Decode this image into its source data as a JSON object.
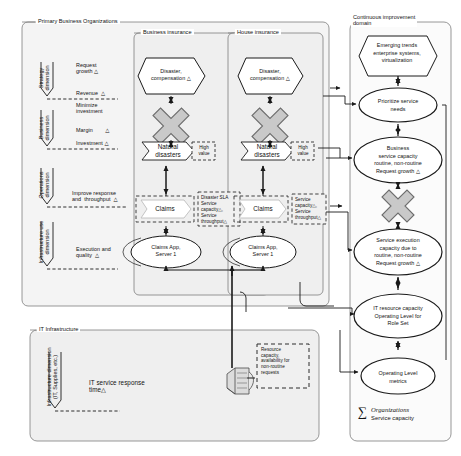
{
  "diagram": {
    "groups": {
      "primary": "Primary Business  Organizations",
      "business_insurance": "Business insurance",
      "house_insurance": "House insurance",
      "continuous_improvement": "Continuous improvement\ndomain",
      "it_infrastructure": "IT Infrastructure"
    },
    "dimensions": [
      {
        "name": "strategy",
        "axis": "Strategy\ndimension",
        "items": [
          "Request\ngrowth △",
          "Revenue  △"
        ]
      },
      {
        "name": "business",
        "axis": "Business\ndimension",
        "items": [
          "Minimize\ninvestment",
          "Margin        △",
          "Investment △"
        ]
      },
      {
        "name": "operations",
        "axis": "Operations\ndimension",
        "items": [
          "Improve response\nand  throughput  △"
        ]
      },
      {
        "name": "infrastructure-use",
        "axis": "Infrastructure use\ndimension",
        "items": [
          "Execution and\nquality  △"
        ]
      }
    ],
    "it_dimension_axis": "Infrastructure dimension\n(IT, Supplies, etc.)",
    "it_service_response": "IT service response\ntime△",
    "resource_note": "Resource\ncapacity,\navailability for\nnon-routine\nrequests",
    "business_insurance_column": {
      "hexagon": "Disaster,\ncompensation △",
      "cross": "conflict-cross",
      "banner": "Natural\ndisasters",
      "side_note": "High\nvalue",
      "claims": "Claims",
      "claims_note": "Disaster SLA\nService\ncapacity△,\nService\nthroughput△",
      "server": "Claims App,\nServer 1"
    },
    "house_insurance_column": {
      "hexagon": "Disaster,\ncompensation △",
      "cross": "conflict-cross",
      "banner": "Natural\ndisasters",
      "side_note": "High\nvalue",
      "claims": "Claims",
      "claims_note": "Service\ncapacity△,\nService\nthroughput△",
      "server": "Claims App,\nServer 1"
    },
    "improvement_nodes": [
      {
        "id": "emerging-trends",
        "shape": "hexagon",
        "label": "Emerging trends\nenterprise systems,\nvirtualization"
      },
      {
        "id": "prioritize-service-needs",
        "shape": "ellipse",
        "label": "Prioritize service\nneeds"
      },
      {
        "id": "business-service-capacity",
        "shape": "ellipse",
        "label": "Business\nservice capacity\nroutine, non-routine\nRequest growth △"
      },
      {
        "id": "conflict-cross",
        "shape": "cross",
        "label": ""
      },
      {
        "id": "service-execution-capacity",
        "shape": "ellipse",
        "label": "Service execution\ncapacity due to\nroutine, non-routine\nRequest growth △"
      },
      {
        "id": "it-resource-capacity",
        "shape": "ellipse",
        "label": "IT resource capacity\nOperating Level for\nRole Set"
      },
      {
        "id": "operating-level-metrics",
        "shape": "ellipse",
        "label": "Operating Level\nmetrics"
      }
    ],
    "summation": {
      "symbol": "∑",
      "line1": "Organizations",
      "line2": "Service capacity"
    },
    "colors": {
      "line": "#1a1a1a",
      "panel_fill": "#f2f2f2",
      "cross_fill": "#c9c9c9",
      "cross_stroke": "#6e6e6e",
      "node_fill": "#ffffff",
      "dashed": "#3a3a3a"
    }
  }
}
